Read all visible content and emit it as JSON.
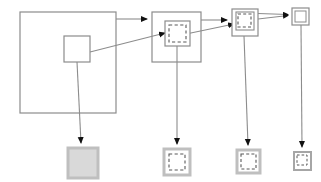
{
  "diagram": {
    "background_color": "#ffffff",
    "stroke_color": "#808080",
    "dark_stroke_color": "#595959",
    "fill_gray": "#bfbfbf",
    "fill_light_gray": "#d9d9d9",
    "arrow_color": "#111111",
    "top_row": {
      "label": "top-row-nodes",
      "nodes": [
        {
          "id": "node-1",
          "name": "large-outer-square",
          "x": 20,
          "y": 12,
          "width": 96,
          "height": 101,
          "style": "solid",
          "fill": "none",
          "children": [
            {
              "id": "node-1-inner",
              "name": "inner-square",
              "x": 64,
              "y": 36,
              "width": 26,
              "height": 26,
              "style": "solid",
              "fill": "none"
            }
          ]
        },
        {
          "id": "node-2",
          "name": "medium-outer-square",
          "x": 152,
          "y": 12,
          "width": 49,
          "height": 50,
          "style": "solid",
          "fill": "none",
          "children": [
            {
              "id": "node-2-mid",
              "name": "middle-square",
              "x": 165,
              "y": 21,
              "width": 25,
              "height": 25,
              "style": "solid",
              "fill": "none"
            },
            {
              "id": "node-2-inner",
              "name": "dashed-inner-square",
              "x": 169,
              "y": 25,
              "width": 17,
              "height": 17,
              "style": "dashed",
              "fill": "none"
            }
          ]
        },
        {
          "id": "node-3",
          "name": "small-outer-square",
          "x": 232,
          "y": 9,
          "width": 26,
          "height": 27,
          "style": "solid",
          "fill": "none",
          "children": [
            {
              "id": "node-3-mid",
              "name": "middle-square",
              "x": 236,
              "y": 12,
              "width": 18,
              "height": 18,
              "style": "solid",
              "fill": "none"
            },
            {
              "id": "node-3-inner",
              "name": "dashed-inner-square",
              "x": 238,
              "y": 14,
              "width": 13,
              "height": 13,
              "style": "dashed",
              "fill": "none"
            }
          ]
        },
        {
          "id": "node-4",
          "name": "tiny-outer-square",
          "x": 292,
          "y": 8,
          "width": 17,
          "height": 17,
          "style": "solid",
          "fill": "none",
          "children": [
            {
              "id": "node-4-inner",
              "name": "inner-square",
              "x": 295,
              "y": 11,
              "width": 11,
              "height": 11,
              "style": "solid",
              "fill": "none"
            }
          ]
        }
      ]
    },
    "bottom_row": {
      "label": "bottom-row-results",
      "nodes": [
        {
          "id": "result-1",
          "name": "filled-gray-square",
          "x": 68,
          "y": 148,
          "width": 30,
          "height": 30,
          "border_style": "solid",
          "border_color": "#bfbfbf",
          "border_width": 3,
          "fill": "#d9d9d9",
          "children": []
        },
        {
          "id": "result-2",
          "name": "gray-square-with-dashed-inner",
          "x": 164,
          "y": 149,
          "width": 26,
          "height": 26,
          "border_style": "solid",
          "border_color": "#bfbfbf",
          "border_width": 3,
          "fill": "#ffffff",
          "children": [
            {
              "id": "result-2-inner",
              "name": "dashed-inner-square",
              "x": 169,
              "y": 154,
              "width": 16,
              "height": 16,
              "style": "dashed",
              "fill": "none"
            }
          ]
        },
        {
          "id": "result-3",
          "name": "gray-square-with-dashed-inner",
          "x": 237,
          "y": 150,
          "width": 23,
          "height": 23,
          "border_style": "solid",
          "border_color": "#bfbfbf",
          "border_width": 3,
          "fill": "#ffffff",
          "children": [
            {
              "id": "result-3-inner",
              "name": "dashed-inner-square",
              "x": 241,
              "y": 154,
              "width": 15,
              "height": 15,
              "style": "dashed",
              "fill": "none"
            }
          ]
        },
        {
          "id": "result-4",
          "name": "small-gray-square-with-inner",
          "x": 294,
          "y": 152,
          "width": 17,
          "height": 18,
          "border_style": "solid",
          "border_color": "#a6a6a6",
          "border_width": 2,
          "fill": "#ffffff",
          "children": [
            {
              "id": "result-4-inner",
              "name": "dashed-inner-square",
              "x": 297,
              "y": 155,
              "width": 10,
              "height": 10,
              "style": "dashed",
              "fill": "none"
            }
          ]
        }
      ]
    },
    "connectors": [
      {
        "id": "conn-1",
        "name": "horizontal-arrow-node1-to-node2",
        "type": "horizontal-arrow",
        "from": "node-1",
        "to": "node-2",
        "x1": 116,
        "y1": 19,
        "x2": 152,
        "y2": 19,
        "arrowhead": true
      },
      {
        "id": "conn-2",
        "name": "diagonal-arrow-node1inner-to-node2inner",
        "type": "diagonal-arrow",
        "from": "node-1-inner",
        "to": "node-2-inner",
        "x1": 90,
        "y1": 52,
        "x2": 169,
        "y2": 32,
        "arrowhead": true
      },
      {
        "id": "conn-3",
        "name": "horizontal-arrow-node2-to-node3",
        "type": "horizontal-arrow",
        "from": "node-2",
        "to": "node-3",
        "x1": 201,
        "y1": 20,
        "x2": 232,
        "y2": 20,
        "arrowhead": true
      },
      {
        "id": "conn-4",
        "name": "diagonal-arrow-node2inner-to-node3",
        "type": "diagonal-arrow",
        "from": "node-2-inner",
        "to": "node-3-inner",
        "x1": 186,
        "y1": 34,
        "x2": 239,
        "y2": 23,
        "arrowhead": true
      },
      {
        "id": "conn-5",
        "name": "horizontal-arrow-node3-to-node4",
        "type": "horizontal-arrow",
        "from": "node-3",
        "to": "node-4",
        "x1": 258,
        "y1": 14,
        "x2": 292,
        "y2": 15,
        "arrowhead": true
      },
      {
        "id": "conn-6",
        "name": "diagonal-arrow-node3inner-to-node4",
        "type": "diagonal-arrow",
        "from": "node-3-inner",
        "to": "node-4",
        "x1": 258,
        "y1": 19,
        "x2": 292,
        "y2": 15,
        "arrowhead": true
      },
      {
        "id": "conn-7",
        "name": "vertical-arrow-node1inner-to-result1",
        "type": "vertical-arrow",
        "from": "node-1-inner",
        "to": "result-1",
        "x1": 77,
        "y1": 62,
        "x2": 81,
        "y2": 146,
        "arrowhead": true
      },
      {
        "id": "conn-8",
        "name": "vertical-arrow-node2inner-to-result2",
        "type": "vertical-arrow",
        "from": "node-2-inner",
        "to": "result-2",
        "x1": 177,
        "y1": 46,
        "x2": 177,
        "y2": 147,
        "arrowhead": true
      },
      {
        "id": "conn-9",
        "name": "vertical-arrow-node3inner-to-result3",
        "type": "vertical-arrow",
        "from": "node-3-inner",
        "to": "result-3",
        "x1": 244,
        "y1": 36,
        "x2": 248,
        "y2": 148,
        "arrowhead": true
      },
      {
        "id": "conn-10",
        "name": "vertical-arrow-node4-to-result4",
        "type": "vertical-arrow",
        "from": "node-4",
        "to": "result-4",
        "x1": 301,
        "y1": 25,
        "x2": 302,
        "y2": 150,
        "arrowhead": true
      }
    ]
  }
}
